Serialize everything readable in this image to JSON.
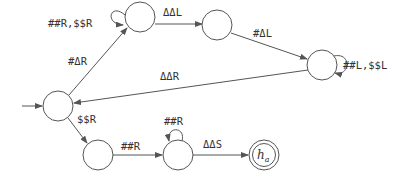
{
  "diagram": {
    "type": "turing-machine-state-diagram",
    "colors": {
      "stroke": "#555555",
      "text": "#333333",
      "background": "#ffffff"
    },
    "states": [
      {
        "id": "q0",
        "label": "",
        "start": true
      },
      {
        "id": "q1",
        "label": ""
      },
      {
        "id": "q2",
        "label": ""
      },
      {
        "id": "q3",
        "label": ""
      },
      {
        "id": "q4",
        "label": ""
      },
      {
        "id": "q5",
        "label": ""
      },
      {
        "id": "ha",
        "label": "h",
        "sub": "a",
        "accepting": true
      }
    ],
    "transitions": [
      {
        "from": "q0",
        "to": "q1",
        "label": "#ΔR"
      },
      {
        "from": "q1",
        "to": "q1",
        "label": "##R,$$R"
      },
      {
        "from": "q1",
        "to": "q2",
        "label": "ΔΔL"
      },
      {
        "from": "q2",
        "to": "q3",
        "label": "#ΔL"
      },
      {
        "from": "q3",
        "to": "q3",
        "label": "##L,$$L"
      },
      {
        "from": "q3",
        "to": "q0",
        "label": "ΔΔR"
      },
      {
        "from": "q0",
        "to": "q4",
        "label": "$$R"
      },
      {
        "from": "q4",
        "to": "q5",
        "label": "##R"
      },
      {
        "from": "q5",
        "to": "q5",
        "label": "##R"
      },
      {
        "from": "q5",
        "to": "ha",
        "label": "ΔΔS"
      }
    ]
  }
}
